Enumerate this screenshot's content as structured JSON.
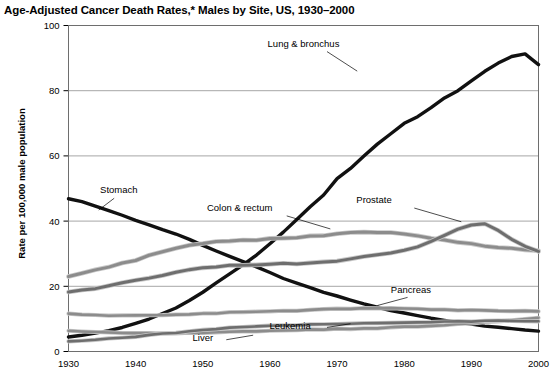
{
  "chart_data": {
    "type": "line",
    "title": "Age-Adjusted Cancer Death Rates,* Males by Site, US, 1930–2000",
    "xlabel": "",
    "ylabel": "Rate per 100,000 male population",
    "xlim": [
      1930,
      2000
    ],
    "ylim": [
      0,
      100
    ],
    "ytick_values": [
      0,
      20,
      40,
      60,
      80,
      100
    ],
    "ytick_labels": [
      "0",
      "20",
      "40",
      "60",
      "80",
      "100"
    ],
    "xtick_values": [
      1930,
      1940,
      1950,
      1960,
      1970,
      1980,
      1990,
      2000
    ],
    "xtick_labels": [
      "1930",
      "1940",
      "1950",
      "1960",
      "1970",
      "1980",
      "1990",
      "2000"
    ],
    "grid": "horizontal",
    "legend_position": "inline-annotations",
    "x": [
      1930,
      1932,
      1934,
      1936,
      1938,
      1940,
      1942,
      1944,
      1946,
      1948,
      1950,
      1952,
      1954,
      1956,
      1958,
      1960,
      1962,
      1964,
      1966,
      1968,
      1970,
      1972,
      1974,
      1976,
      1978,
      1980,
      1982,
      1984,
      1986,
      1988,
      1990,
      1992,
      1994,
      1996,
      1998,
      2000
    ],
    "series": [
      {
        "name": "Lung & bronchus",
        "color": "#111111",
        "width": 3.4,
        "values": [
          4.5,
          5.0,
          5.6,
          6.4,
          7.4,
          8.6,
          10.0,
          11.6,
          13.4,
          15.6,
          18.2,
          21.0,
          23.8,
          26.6,
          29.6,
          33.0,
          36.6,
          40.5,
          44.4,
          48.0,
          53.0,
          56.2,
          60.0,
          63.6,
          66.8,
          70.0,
          72.0,
          74.8,
          77.8,
          80.0,
          83.0,
          86.0,
          88.5,
          90.5,
          91.3,
          88.0
        ],
        "label_x": 1965,
        "label_y": 93.5,
        "leader": [
          [
            1968.5,
            92.0
          ],
          [
            1973.0,
            86.0
          ]
        ]
      },
      {
        "name": "Stomach",
        "color": "#111111",
        "width": 3.4,
        "values": [
          46.8,
          46.0,
          44.6,
          43.2,
          41.8,
          40.2,
          38.8,
          37.4,
          36.0,
          34.4,
          32.6,
          30.8,
          29.2,
          27.6,
          26.0,
          24.2,
          22.4,
          21.0,
          19.6,
          18.2,
          17.0,
          15.8,
          14.6,
          13.6,
          12.6,
          11.8,
          11.0,
          10.2,
          9.6,
          9.0,
          8.4,
          7.8,
          7.4,
          7.0,
          6.6,
          6.2
        ],
        "label_x": 1937.5,
        "label_y": 48.5,
        "leader": [
          [
            1936.8,
            47.0
          ],
          [
            1934.5,
            43.4
          ]
        ]
      },
      {
        "name": "Colon & rectum",
        "color": "#8c8c8c",
        "width": 3.0,
        "values": [
          23.0,
          24.0,
          25.0,
          26.0,
          27.0,
          28.0,
          29.4,
          30.6,
          31.6,
          32.6,
          33.2,
          33.8,
          34.0,
          34.2,
          34.2,
          34.6,
          34.8,
          35.0,
          35.4,
          35.6,
          36.0,
          36.4,
          36.6,
          36.6,
          36.4,
          36.0,
          35.4,
          34.8,
          34.2,
          33.6,
          33.0,
          32.4,
          32.0,
          31.6,
          31.2,
          31.0
        ],
        "label_x": 1955.5,
        "label_y": 43.0,
        "leader": [
          [
            1962.5,
            41.6
          ],
          [
            1969.0,
            37.6
          ]
        ]
      },
      {
        "name": "Prostate",
        "color": "#6e6e6e",
        "width": 3.0,
        "values": [
          18.2,
          18.8,
          19.4,
          20.2,
          21.0,
          21.8,
          22.6,
          23.4,
          24.2,
          25.0,
          25.6,
          26.0,
          26.4,
          26.4,
          26.6,
          26.8,
          27.0,
          27.0,
          27.2,
          27.4,
          27.8,
          28.4,
          29.0,
          29.6,
          30.2,
          31.0,
          32.2,
          33.8,
          35.6,
          37.6,
          38.8,
          39.2,
          37.2,
          34.4,
          32.2,
          30.8
        ],
        "label_x": 1975.5,
        "label_y": 45.5,
        "leader": [
          [
            1981.5,
            44.0
          ],
          [
            1988.5,
            39.8
          ]
        ]
      },
      {
        "name": "Pancreas",
        "color": "#8c8c8c",
        "width": 2.6,
        "values": [
          11.6,
          11.4,
          11.2,
          11.1,
          11.0,
          11.0,
          11.0,
          11.1,
          11.2,
          11.4,
          11.6,
          11.8,
          12.0,
          12.1,
          12.2,
          12.4,
          12.5,
          12.6,
          12.8,
          12.9,
          13.0,
          13.1,
          13.2,
          13.2,
          13.2,
          13.1,
          13.0,
          12.9,
          12.8,
          12.7,
          12.6,
          12.6,
          12.5,
          12.5,
          12.4,
          12.3
        ],
        "label_x": 1981.0,
        "label_y": 17.8,
        "leader": [
          [
            1980.5,
            16.6
          ],
          [
            1976.0,
            14.1
          ]
        ]
      },
      {
        "name": "Liver",
        "color": "#8c8c8c",
        "width": 2.6,
        "values": [
          6.4,
          6.2,
          6.0,
          5.9,
          5.8,
          5.7,
          5.6,
          5.6,
          5.6,
          5.7,
          5.8,
          5.9,
          6.0,
          6.1,
          6.2,
          6.4,
          6.5,
          6.6,
          6.7,
          6.8,
          6.9,
          7.0,
          7.1,
          7.2,
          7.3,
          7.5,
          7.7,
          7.9,
          8.1,
          8.4,
          8.6,
          8.9,
          9.2,
          9.6,
          10.0,
          10.4
        ],
        "label_x": 1950.0,
        "label_y": 3.2,
        "leader": [
          [
            1953.5,
            3.6
          ],
          [
            1957.5,
            5.0
          ]
        ]
      },
      {
        "name": "Leukemia",
        "color": "#6e6e6e",
        "width": 2.6,
        "values": [
          3.0,
          3.3,
          3.6,
          3.9,
          4.2,
          4.6,
          5.0,
          5.4,
          5.8,
          6.2,
          6.6,
          6.9,
          7.2,
          7.4,
          7.6,
          7.8,
          8.0,
          8.1,
          8.2,
          8.3,
          8.4,
          8.5,
          8.6,
          8.6,
          8.7,
          8.8,
          8.9,
          9.0,
          9.1,
          9.2,
          9.3,
          9.4,
          9.4,
          9.4,
          9.4,
          9.3
        ]
      }
    ],
    "annotations": [
      {
        "name": "leukemia-label",
        "text": "Leukemia",
        "x": 1963.0,
        "y": 6.9,
        "leader": [
          [
            1968.5,
            7.4
          ],
          [
            1972.0,
            8.5
          ]
        ]
      }
    ],
    "footnote_marker": "*"
  }
}
